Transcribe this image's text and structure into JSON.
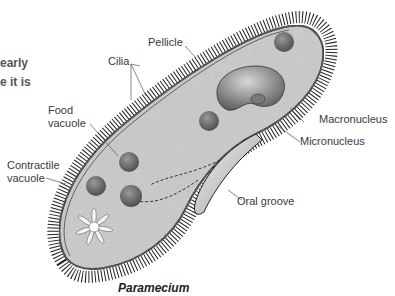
{
  "side_text": {
    "line1": "early",
    "line2": "e it is"
  },
  "labels": {
    "pellicle": "Pellicle",
    "cilia": "Cilia",
    "food_vacuole_1": "Food",
    "food_vacuole_2": "vacuole",
    "contractile_vacuole_1": "Contractile",
    "contractile_vacuole_2": "vacuole",
    "macronucleus": "Macronucleus",
    "micronucleus": "Micronucleus",
    "oral_groove": "Oral groove"
  },
  "caption": "Paramecium",
  "colors": {
    "cell_fill": "#c9c9c9",
    "outline": "#1a1a1a",
    "label_text": "#3a3a3a",
    "nucleus": "#8a8a8a"
  }
}
